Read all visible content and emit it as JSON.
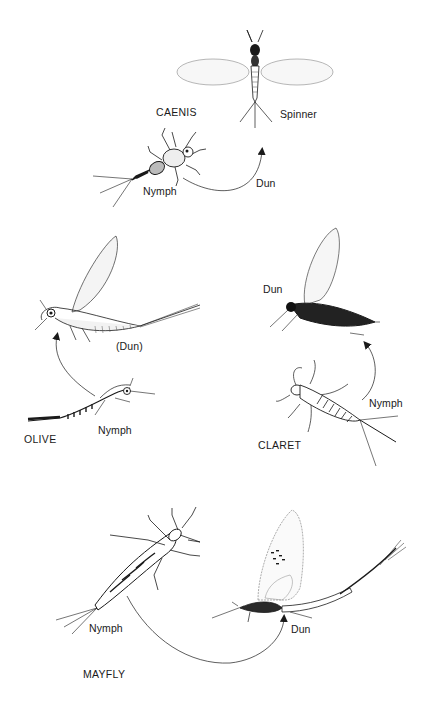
{
  "figure": {
    "groups": [
      {
        "name": "CAENIS",
        "stages": [
          {
            "label": "Nymph"
          },
          {
            "label": "Dun"
          },
          {
            "label": "Spinner"
          }
        ]
      },
      {
        "name": "OLIVE",
        "stages": [
          {
            "label": "Nymph"
          },
          {
            "label": "(Dun)"
          }
        ]
      },
      {
        "name": "CLARET",
        "stages": [
          {
            "label": "Nymph"
          },
          {
            "label": "Dun"
          }
        ]
      },
      {
        "name": "MAYFLY",
        "stages": [
          {
            "label": "Nymph"
          },
          {
            "label": "Dun"
          }
        ]
      }
    ],
    "colors": {
      "ink": "#1a1a1a",
      "background": "#ffffff",
      "wing": "#c8c8c8"
    }
  }
}
